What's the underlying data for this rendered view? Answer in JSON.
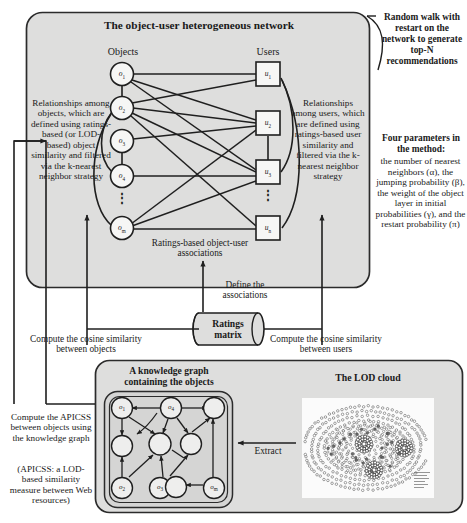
{
  "figure": {
    "title_main": "The object-user heterogeneous network"
  },
  "network": {
    "objects_header": "Objects",
    "users_header": "Users",
    "caption": "Ratings-based object-user associations",
    "object_nodes": [
      {
        "id": "o1",
        "base": "o",
        "sub": "1"
      },
      {
        "id": "o2",
        "base": "o",
        "sub": "2"
      },
      {
        "id": "o3",
        "base": "o",
        "sub": "3"
      },
      {
        "id": "o4",
        "base": "o",
        "sub": "4"
      },
      {
        "id": "om",
        "base": "o",
        "sub": "m"
      }
    ],
    "user_nodes": [
      {
        "id": "u1",
        "base": "u",
        "sub": "1"
      },
      {
        "id": "u2",
        "base": "u",
        "sub": "2"
      },
      {
        "id": "u3",
        "base": "u",
        "sub": "3"
      },
      {
        "id": "un",
        "base": "u",
        "sub": "n"
      }
    ],
    "ellipsis": "⋮"
  },
  "annotations": {
    "left_objects": "Relationships among objects, which are defined using ratings-based (or LOD-based) object similarity and filtered via the k-nearest neighbor strategy",
    "right_users": "Relationships among users, which are defined using ratings-based user similarity and filtered via the k-nearest neighbor strategy",
    "random_walk": "Random walk with restart on the network to generate top-N recommendations",
    "four_parameters_title": "Four parameters in the method:",
    "four_parameters_body": "the number of nearest neighbors (α), the jumping probability (β), the weight of the object layer in initial probabilities (γ), and the restart probability (π)",
    "define_associations": "Define the associations",
    "cosine_objects": "Compute the cosine similarity between objects",
    "cosine_users": "Compute the cosine similarity between users",
    "apicss_compute": "Compute the APICSS between objects using the knowledge graph",
    "apicss_note": "(APICSS: a LOD-based similarity measure between Web resources)",
    "extract": "Extract"
  },
  "ratings_matrix": {
    "line1": "Ratings",
    "line2": "matrix"
  },
  "bottom_panel": {
    "kg_title_line1": "A knowledge graph",
    "kg_title_line2": "containing the objects",
    "lod_title": "The LOD cloud",
    "kg_nodes": [
      {
        "id": "o1",
        "base": "o",
        "sub": "1"
      },
      {
        "id": "o4",
        "base": "o",
        "sub": "4"
      },
      {
        "id": "o2",
        "base": "o",
        "sub": "2"
      },
      {
        "id": "o3",
        "base": "o",
        "sub": "3"
      },
      {
        "id": "om",
        "base": "o",
        "sub": "m"
      }
    ]
  },
  "colors": {
    "panel_fill": "#dededd",
    "panel_stroke": "#2b2b2b",
    "node_fill": "#f4f4f3",
    "line": "#1f1f1f",
    "page_bg": "#ffffff"
  }
}
